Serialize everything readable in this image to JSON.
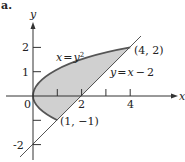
{
  "corner_label": "a.",
  "axes": {
    "x_label": "x",
    "y_label": "y",
    "x_ticks": [
      "0",
      "2",
      "4"
    ],
    "y_ticks": [
      "2",
      "1",
      "-2"
    ]
  },
  "curves": {
    "parabola_label": "x = y²",
    "parabola_lhs": "x",
    "parabola_eq": "=",
    "parabola_rhs": "y",
    "parabola_exp": "2",
    "line_label": "y = x − 2",
    "line_lhs": "y",
    "line_eq": "=",
    "line_rhs": "x",
    "line_op": "−",
    "line_const": "2"
  },
  "points": [
    {
      "label": "(4, 2)",
      "x": 4,
      "y": 2
    },
    {
      "label": "(1, −1)",
      "x": 1,
      "y": -1
    }
  ],
  "colors": {
    "region_fill": "#d0d0d0",
    "curve_stroke": "#555555",
    "axis_stroke": "#333333"
  }
}
